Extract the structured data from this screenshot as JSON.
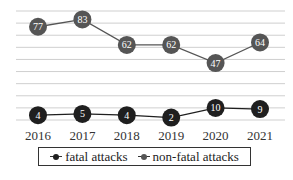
{
  "chart_data": {
    "type": "line",
    "title": "",
    "xlabel": "",
    "ylabel": "",
    "x": [
      "2016",
      "2017",
      "2018",
      "2019",
      "2020",
      "2021"
    ],
    "series": [
      {
        "name": "fatal attacks",
        "values": [
          4,
          5,
          4,
          2,
          10,
          9
        ],
        "color": "#1f1f1f"
      },
      {
        "name": "non-fatal attacks",
        "values": [
          77,
          83,
          62,
          62,
          47,
          64
        ],
        "color": "#555555"
      }
    ],
    "ylim": [
      0,
      90
    ],
    "ytick_step": 10,
    "grid": true,
    "y_axis_labels_visible": false,
    "data_labels": true,
    "legend_position": "bottom"
  },
  "legend": {
    "items": [
      {
        "label": "fatal attacks"
      },
      {
        "label": "non-fatal attacks"
      }
    ]
  }
}
